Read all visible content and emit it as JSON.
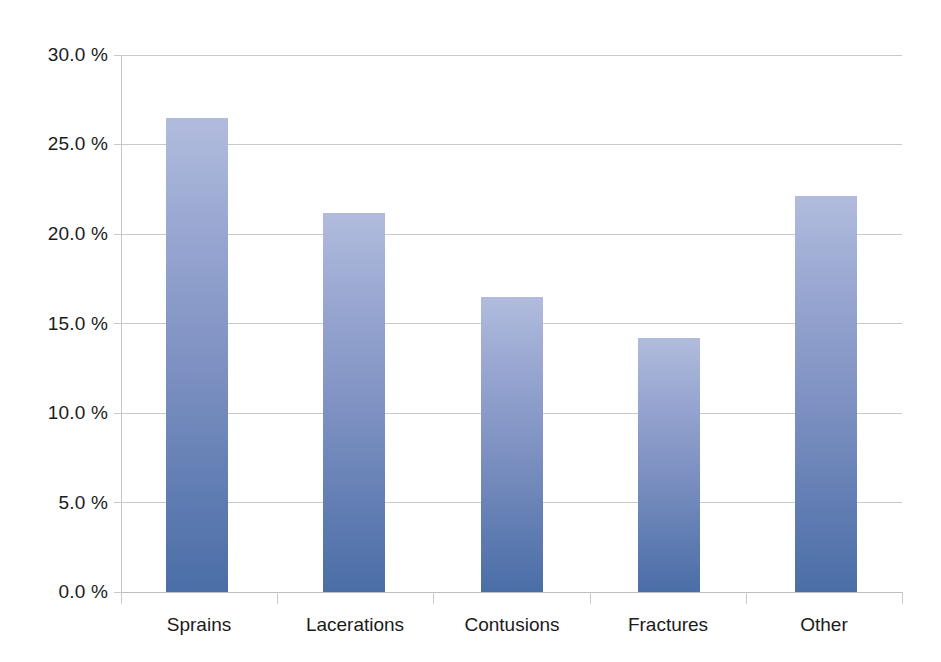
{
  "chart_data": {
    "type": "bar",
    "title": "",
    "subtitle": "",
    "xlabel": "",
    "ylabel": "",
    "categories": [
      "Sprains",
      "Lacerations",
      "Contusions",
      "Fractures",
      "Other"
    ],
    "values": [
      26.5,
      21.2,
      16.5,
      14.2,
      22.1
    ],
    "value_labels": [
      "26.5 %",
      "21.2 %",
      "16.5 %",
      "14.2 %",
      "22.1 %"
    ],
    "series": [
      {
        "name": "Percent of injuries",
        "values": [
          26.5,
          21.2,
          16.5,
          14.2,
          22.1
        ]
      }
    ],
    "ylim": [
      0,
      30
    ],
    "ytick_values": [
      30.0,
      25.0,
      20.0,
      15.0,
      10.0,
      5.0,
      0.0
    ],
    "ytick_labels": [
      "30.0 %",
      "25.0 %",
      "20.0 %",
      "15.0 %",
      "10.0 %",
      "5.0 %",
      "0.0 %"
    ],
    "grid": true,
    "grid_axis": "y",
    "legend": false,
    "legend_position": "none",
    "annotations": [],
    "colors": {
      "bar_top": "#b1bcdd",
      "bar_bottom": "#4a6ea6",
      "gridline": "#c9c9c9",
      "axis": "#bdbdbd",
      "text": "#1b1b1b",
      "background": "#ffffff"
    }
  }
}
